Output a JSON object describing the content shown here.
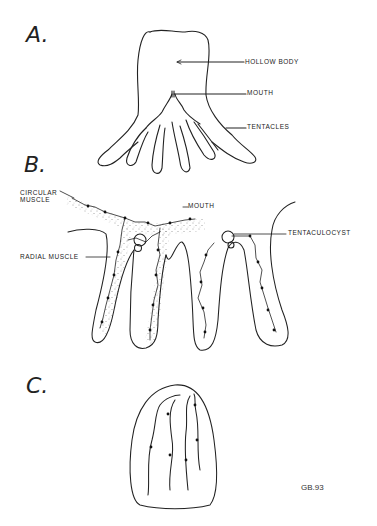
{
  "figure": {
    "panels": [
      {
        "letter": "A.",
        "labels": {
          "hollow_body": "HOLLOW BODY",
          "mouth": "MOUTH",
          "tentacles": "TENTACLES"
        }
      },
      {
        "letter": "B.",
        "labels": {
          "circular_muscle_line1": "CIRCULAR",
          "circular_muscle_line2": "MUSCLE",
          "mouth": "MOUTH",
          "radial_muscle": "RADIAL MUSCLE",
          "tentaculocyst": "TENTACULOCYST"
        }
      },
      {
        "letter": "C.",
        "labels": {}
      }
    ],
    "signature": "GB.93",
    "colors": {
      "ink": "#222222",
      "background": "#ffffff"
    }
  }
}
